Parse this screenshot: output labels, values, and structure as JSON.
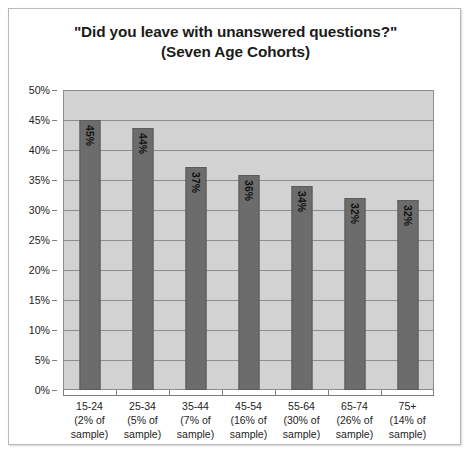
{
  "chart_data": {
    "type": "bar",
    "title": "\"Did you leave with unanswered questions?\"",
    "subtitle": "(Seven Age Cohorts)",
    "xlabel": "",
    "ylabel": "",
    "ylim": [
      0,
      50
    ],
    "ytick_step": 5,
    "grid": true,
    "legend": false,
    "value_label_suffix": "%",
    "value_label_rotation": 90,
    "categories": [
      "15-24",
      "25-34",
      "35-44",
      "45-54",
      "55-64",
      "65-74",
      "75+"
    ],
    "category_sublabels": [
      [
        "(2% of",
        "sample)"
      ],
      [
        "(5% of",
        "sample)"
      ],
      [
        "(7% of",
        "sample)"
      ],
      [
        "(16% of",
        "sample)"
      ],
      [
        "(30% of",
        "sample)"
      ],
      [
        "(26% of",
        "sample)"
      ],
      [
        "(14% of",
        "sample)"
      ]
    ],
    "values": [
      45,
      44,
      37,
      36,
      34,
      32,
      32
    ],
    "value_labels": [
      "45%",
      "44%",
      "37%",
      "36%",
      "34%",
      "32%",
      "32%"
    ],
    "bar_heights_exact": [
      45.0,
      43.6,
      37.1,
      35.8,
      34.0,
      32.0,
      31.6
    ],
    "ytick_labels": [
      "50%",
      "45%",
      "40%",
      "35%",
      "30%",
      "25%",
      "20%",
      "15%",
      "10%",
      "5%",
      "0%"
    ],
    "ytick_values": [
      50,
      45,
      40,
      35,
      30,
      25,
      20,
      15,
      10,
      5,
      0
    ],
    "colors": {
      "bar_fill": "#6c6c6c",
      "bar_border": "#5b5b5b",
      "plot_background": "#d2d2d2",
      "gridline": "#8e8e8e",
      "axis_line": "#7d7d7d",
      "text": "#1b1b1b",
      "frame_border": "#b9b9b9",
      "page_background": "#ffffff"
    }
  }
}
